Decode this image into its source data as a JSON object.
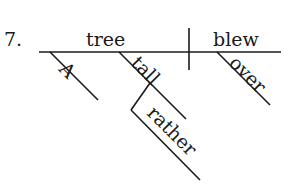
{
  "diagram": {
    "type": "sentence-diagram",
    "item_number": "7.",
    "subject": "tree",
    "verb": "blew",
    "modifiers": {
      "subject": [
        {
          "word": "A",
          "role": "article"
        },
        {
          "word": "tall",
          "role": "adjective",
          "modifier": {
            "word": "rather",
            "role": "adverb"
          }
        }
      ],
      "verb": [
        {
          "word": "over",
          "role": "adverb"
        }
      ]
    },
    "colors": {
      "ink": "#1a1a1a",
      "background": "#ffffff"
    }
  }
}
